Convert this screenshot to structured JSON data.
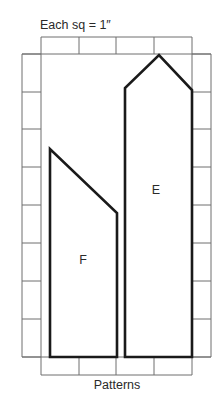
{
  "title": "Each sq = 1″",
  "footer": "Patterns",
  "grid": {
    "columns_x": [
      41,
      79,
      116,
      154,
      192
    ],
    "rows_y": [
      54,
      92,
      129,
      167,
      205,
      243,
      281,
      319,
      357
    ],
    "top_strip": {
      "y0": 37,
      "y1": 54
    },
    "bottom_strip": {
      "y0": 357,
      "y1": 375
    },
    "left_strip": {
      "x0": 22,
      "x1": 41
    },
    "right_strip": {
      "x0": 192,
      "x1": 211
    },
    "unit": "1 inch per square"
  },
  "patterns": [
    {
      "label": "E",
      "description": "Tall pentagon with pointed top",
      "points": [
        [
          125,
          357
        ],
        [
          125,
          88
        ],
        [
          159,
          55
        ],
        [
          192,
          90
        ],
        [
          192,
          357
        ]
      ],
      "label_pos": [
        156,
        194
      ]
    },
    {
      "label": "F",
      "description": "Trapezoid with slanted top",
      "points": [
        [
          50,
          357
        ],
        [
          50,
          149
        ],
        [
          117,
          213
        ],
        [
          117,
          357
        ]
      ],
      "label_pos": [
        83,
        264
      ]
    }
  ],
  "colors": {
    "grid": "#6e6e6e",
    "outline": "#1a1a1a",
    "text": "#2a2a2a",
    "background": "#ffffff"
  }
}
